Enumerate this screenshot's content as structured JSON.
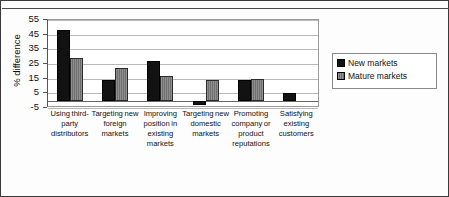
{
  "chart_data": {
    "type": "bar",
    "title": "",
    "xlabel": "",
    "ylabel": "% difference",
    "ylim": [
      -5,
      55
    ],
    "yticks": [
      -5,
      5,
      15,
      25,
      35,
      45,
      55
    ],
    "grid": true,
    "legend_position": "right",
    "categories": [
      "Using third-party distributors",
      "Targeting new foreign markets",
      "Improving position in existing markets",
      "Targeting new domestic markets",
      "Promoting company or product reputations",
      "Satisfying existing customers"
    ],
    "series": [
      {
        "name": "New markets",
        "color": "#121212",
        "values": [
          48,
          14,
          27,
          -3,
          14,
          5
        ]
      },
      {
        "name": "Mature markets",
        "color": "#7f7f7f",
        "values": [
          29,
          22,
          17,
          14,
          15,
          0
        ]
      }
    ]
  },
  "axis": {
    "y_title": "% difference",
    "y_tick_labels": [
      "55",
      "45",
      "35",
      "25",
      "15",
      "5",
      "-5"
    ]
  },
  "legend": {
    "items": [
      {
        "label": "New markets",
        "swatch": "dark-swatch-icon"
      },
      {
        "label": "Mature markets",
        "swatch": "hatched-swatch-icon"
      }
    ]
  },
  "categories_display": [
    "Using third-\nparty\ndistributors",
    "Targeting new\nforeign\nmarkets",
    "Improving\nposition in\nexisting\nmarkets",
    "Targeting new\ndomestic\nmarkets",
    "Promoting\ncompany or\nproduct\nreputations",
    "Satisfying\nexisting\ncustomers"
  ]
}
